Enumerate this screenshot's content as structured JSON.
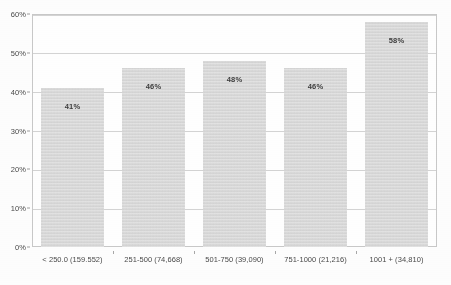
{
  "chart_data": {
    "type": "bar",
    "title": "",
    "subtitle": "",
    "xlabel": "",
    "ylabel": "",
    "categories": [
      "< 250.0 (159.552)",
      "251-500 (74,668)",
      "501-750 (39,090)",
      "751-1000 (21,216)",
      "1001 + (34,810)"
    ],
    "values": [
      41,
      46,
      48,
      46,
      58
    ],
    "value_labels": [
      "41%",
      "46%",
      "48%",
      "46%",
      "58%"
    ],
    "ylim": [
      0,
      60
    ],
    "yticks": [
      0,
      10,
      20,
      30,
      40,
      50,
      60
    ],
    "ytick_labels": [
      "0%",
      "10%",
      "20%",
      "30%",
      "40%",
      "50%",
      "60%"
    ],
    "grid": true,
    "legend": false,
    "legend_position": "none",
    "bar_color": "#d7d7d7",
    "grid_color": "#d4d4d4",
    "axis_color": "#c9c9c9",
    "label_color": "#4a4a4a",
    "value_label_color": "#3d3d3d"
  }
}
